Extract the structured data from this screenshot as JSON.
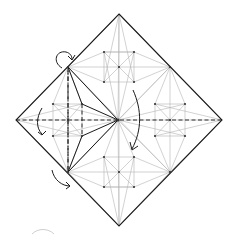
{
  "diagram": {
    "type": "crease-pattern",
    "colors": {
      "crease": "#b4b4b4",
      "edge": "#1a1a1a",
      "background": "#ffffff"
    },
    "legend": {
      "valley_fold": "dashed line",
      "mountain_fold": "dash-dot line",
      "reference_crease": "thin gray line"
    },
    "fold_arrows": [
      {
        "id": "arrow-top-left-corner",
        "description": "curved arrow folding over at upper-left edge point"
      },
      {
        "id": "arrow-left",
        "description": "curved arrow folding left section downward"
      },
      {
        "id": "arrow-bottom-left",
        "description": "curved arrow folding along lower-left edge"
      },
      {
        "id": "arrow-center",
        "description": "large curved arrow swinging down from top region past center"
      }
    ]
  }
}
